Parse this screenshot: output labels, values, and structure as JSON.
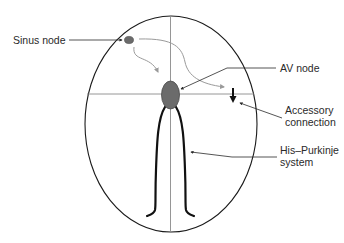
{
  "diagram": {
    "labels": {
      "sinus_node": "Sinus node",
      "av_node": "AV node",
      "accessory_line1": "Accessory",
      "accessory_line2": "connection",
      "his_line1": "His–Purkinje",
      "his_line2": "system"
    },
    "colors": {
      "background": "#ffffff",
      "outline": "#1a1a1a",
      "node_fill": "#6b6b6b",
      "node_stroke": "#4a4a4a",
      "axis_line": "#8a8a8a",
      "impulse_arrow": "#9a9a9a",
      "leader_line": "#2a2a2a",
      "text": "#2a2a2a"
    }
  }
}
